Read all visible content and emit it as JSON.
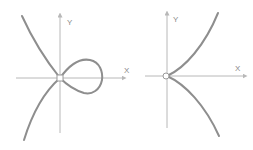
{
  "diagrams": [
    {
      "name": "nodal-cubic",
      "x_label": "X",
      "y_label": "Y",
      "description": "curve with a self-intersecting loop (node) at the origin"
    },
    {
      "name": "cuspidal-cubic",
      "x_label": "X",
      "y_label": "Y",
      "description": "semicubical parabola with a cusp at the origin"
    }
  ],
  "colors": {
    "axis": "#b8b8b8",
    "curve": "#8e8e8e",
    "background": "#ffffff"
  }
}
